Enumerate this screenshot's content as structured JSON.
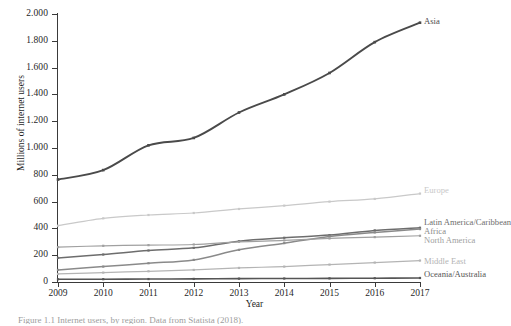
{
  "figure": {
    "caption": "Figure 1.1 Internet users, by region. Data from Statista (2018)."
  },
  "axes": {
    "y_title": "Millions of internet users",
    "x_title": "Year",
    "y_ticks": [
      "2.000",
      "1.800",
      "1.600",
      "1.400",
      "1.200",
      "1.000",
      "800",
      "600",
      "400",
      "200",
      "0"
    ],
    "x_ticks": [
      "2009",
      "2010",
      "2011",
      "2012",
      "2013",
      "2014",
      "2015",
      "2016",
      "2017"
    ]
  },
  "colors": {
    "asia": "#4a4a4a",
    "europe": "#c9c9c9",
    "latin_america": "#6d6d6d",
    "africa": "#8a8a8a",
    "north_america": "#a0a0a0",
    "middle_east": "#b4b4b4",
    "oceania": "#555555",
    "axis": "#3a3a3a"
  },
  "chart_data": {
    "type": "line",
    "title": "",
    "xlabel": "Year",
    "ylabel": "Millions of internet users",
    "xlim": [
      2009,
      2017
    ],
    "ylim": [
      0,
      2000
    ],
    "grid": false,
    "legend": "right-inline-labels",
    "categories": [
      "2009",
      "2010",
      "2011",
      "2012",
      "2013",
      "2014",
      "2015",
      "2016",
      "2017"
    ],
    "series": [
      {
        "name": "Asia",
        "values": [
          765,
          835,
          1020,
          1075,
          1265,
          1400,
          1560,
          1790,
          1935
        ]
      },
      {
        "name": "Europe",
        "values": [
          420,
          475,
          500,
          515,
          545,
          570,
          600,
          620,
          660
        ]
      },
      {
        "name": "Latin America/Caribbean",
        "values": [
          180,
          205,
          235,
          255,
          305,
          330,
          350,
          385,
          405
        ]
      },
      {
        "name": "Africa",
        "values": [
          90,
          115,
          140,
          165,
          240,
          290,
          340,
          370,
          395
        ]
      },
      {
        "name": "North America",
        "values": [
          260,
          270,
          275,
          280,
          300,
          310,
          325,
          335,
          345
        ]
      },
      {
        "name": "Middle East",
        "values": [
          60,
          70,
          80,
          90,
          105,
          115,
          130,
          145,
          160
        ]
      },
      {
        "name": "Oceania/Australia",
        "values": [
          20,
          21,
          22,
          23,
          25,
          26,
          27,
          28,
          30
        ]
      }
    ]
  },
  "series_labels": [
    {
      "name": "Asia",
      "text": "Asia"
    },
    {
      "name": "Europe",
      "text": "Europe"
    },
    {
      "name": "Latin America/Caribbean",
      "text": "Latin America/Caribbean"
    },
    {
      "name": "Africa",
      "text": "Africa"
    },
    {
      "name": "North America",
      "text": "North America"
    },
    {
      "name": "Middle East",
      "text": "Middle East"
    },
    {
      "name": "Oceania/Australia",
      "text": "Oceania/Australia"
    }
  ]
}
